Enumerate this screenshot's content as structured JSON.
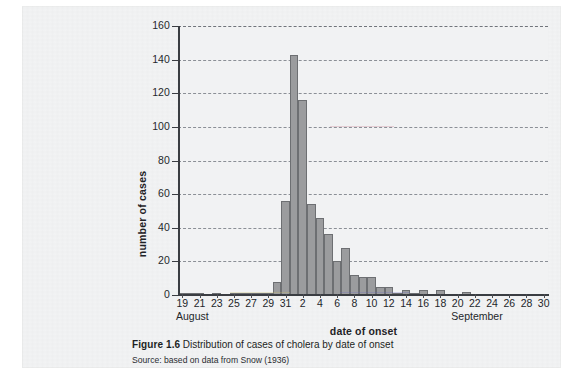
{
  "figure": {
    "number_label": "Figure 1.6",
    "caption": "Distribution of cases of cholera by date of onset",
    "source": "Source: based on data from Snow (1936)"
  },
  "chart_data": {
    "type": "bar",
    "title": "Distribution of cases of cholera by date of onset",
    "xlabel": "date of onset",
    "ylabel": "number of cases",
    "ylim": [
      0,
      160
    ],
    "ytick_step": 20,
    "yticks": [
      0,
      20,
      40,
      60,
      80,
      100,
      120,
      140,
      160
    ],
    "ytick_labels": [
      "0",
      "20",
      "40",
      "60",
      "80",
      "100",
      "120",
      "140",
      "160"
    ],
    "grid": "horizontal-dashed",
    "legend": "none",
    "bar_fill_color": "#9b9c9e",
    "bar_edge_color": "#6d6f72",
    "plot_background": "#f1f2f3",
    "month_labels": [
      {
        "text": "August",
        "at_category": "19"
      },
      {
        "text": "September",
        "at_category": "20"
      }
    ],
    "xtick_labels": [
      "19",
      "21",
      "23",
      "25",
      "27",
      "29",
      "31",
      "2",
      "4",
      "6",
      "8",
      "10",
      "12",
      "14",
      "16",
      "18",
      "20",
      "22",
      "24",
      "26",
      "28",
      "30"
    ],
    "categories": [
      "19 Aug",
      "20 Aug",
      "21 Aug",
      "22 Aug",
      "23 Aug",
      "24 Aug",
      "25 Aug",
      "26 Aug",
      "27 Aug",
      "28 Aug",
      "29 Aug",
      "30 Aug",
      "31 Aug",
      "1 Sep",
      "2 Sep",
      "3 Sep",
      "4 Sep",
      "5 Sep",
      "6 Sep",
      "7 Sep",
      "8 Sep",
      "9 Sep",
      "10 Sep",
      "11 Sep",
      "12 Sep",
      "13 Sep",
      "14 Sep",
      "15 Sep",
      "16 Sep",
      "17 Sep",
      "18 Sep",
      "19 Sep",
      "20 Sep",
      "21 Sep",
      "22 Sep",
      "23 Sep",
      "24 Sep",
      "25 Sep",
      "26 Sep",
      "27 Sep",
      "28 Sep",
      "29 Sep",
      "30 Sep"
    ],
    "values": [
      1,
      1,
      1,
      0,
      1,
      0,
      1,
      1,
      1,
      1,
      1,
      8,
      56,
      143,
      116,
      54,
      46,
      36,
      20,
      28,
      12,
      11,
      11,
      5,
      5,
      1,
      3,
      1,
      3,
      0,
      3,
      0,
      0,
      2,
      0,
      0,
      0,
      0,
      0,
      0,
      0,
      0,
      0
    ]
  }
}
